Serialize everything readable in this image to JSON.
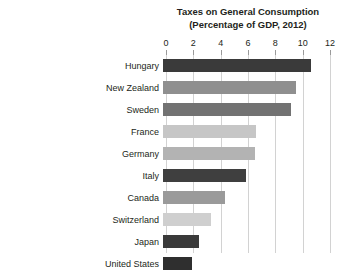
{
  "artifact_text": "",
  "chart_data": {
    "type": "bar",
    "orientation": "horizontal",
    "title": "Taxes on General Consumption",
    "subtitle": "(Percentage of GDP, 2012)",
    "xlabel": "",
    "ylabel": "",
    "xlim": [
      0,
      12
    ],
    "xticks": [
      0,
      2,
      4,
      6,
      8,
      10,
      12
    ],
    "xtick_labels": [
      "0",
      "2",
      "4",
      "6",
      "8",
      "10",
      "12"
    ],
    "grid": "vertical",
    "legend": "none",
    "categories": [
      "Hungary",
      "New Zealand",
      "Sweden",
      "France",
      "Germany",
      "Italy",
      "Canada",
      "Switzerland",
      "Japan",
      "United States"
    ],
    "values": [
      10.8,
      9.7,
      9.4,
      6.8,
      6.7,
      6.1,
      4.5,
      3.5,
      2.6,
      2.1
    ],
    "bar_colors": [
      "#3a3a3a",
      "#8f8f8f",
      "#727272",
      "#c6c6c6",
      "#b3b3b3",
      "#3f3f3f",
      "#9a9a9a",
      "#cfcfcf",
      "#3a3a3a",
      "#2f2f2f"
    ],
    "grid_color": "#d2d2d2",
    "text_color": "#231f20"
  }
}
